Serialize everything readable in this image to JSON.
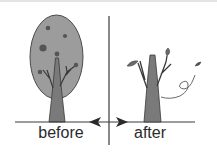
{
  "diagram": {
    "labels": {
      "before": "before",
      "after": "after"
    },
    "panels": [
      {
        "id": "before",
        "state": "tree with full oval canopy with fruits"
      },
      {
        "id": "after",
        "state": "bare tree with a few leaves, one leaf blowing away"
      }
    ],
    "colors": {
      "canopy": "#9c9c9c",
      "trunk": "#7a7a7a",
      "fruit": "#555555",
      "leaf": "#6a6a6a",
      "line": "#3a3a3a",
      "text": "#2b2b2b"
    }
  }
}
